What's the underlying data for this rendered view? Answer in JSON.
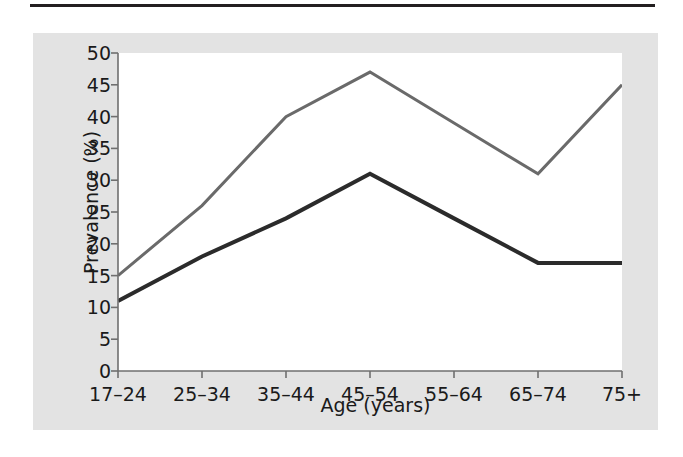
{
  "figure": {
    "background_color": "#ffffff",
    "panel_color": "#e3e3e3",
    "plot_background_color": "#ffffff",
    "rule_color": "#231f20"
  },
  "chart_data": {
    "type": "line",
    "title": "",
    "subtitle": "",
    "xlabel": "Age (years)",
    "ylabel": "Prevalence (%)",
    "categories": [
      "17–24",
      "25–34",
      "35–44",
      "45–54",
      "55–64",
      "65–74",
      "75+"
    ],
    "ylim": [
      0,
      50
    ],
    "yticks": [
      0,
      5,
      10,
      15,
      20,
      25,
      30,
      35,
      40,
      45,
      50
    ],
    "ytick_labels": [
      "0",
      "5",
      "10",
      "15",
      "20",
      "25",
      "30",
      "35",
      "40",
      "45",
      "50"
    ],
    "grid": false,
    "legend": null,
    "legend_position": "none",
    "annotations": [],
    "series": [
      {
        "name": "upper-series",
        "color": "#6a6a6a",
        "line_width": 3,
        "values": [
          15,
          26,
          40,
          47,
          39,
          31,
          45
        ]
      },
      {
        "name": "lower-series",
        "color": "#2b2b2b",
        "line_width": 4,
        "values": [
          11,
          18,
          24,
          31,
          24,
          17,
          17
        ]
      }
    ]
  },
  "axes": {
    "tick_color": "#6f6f6f",
    "axis_color": "#6f6f6f",
    "label_color": "#1a1a1a"
  }
}
